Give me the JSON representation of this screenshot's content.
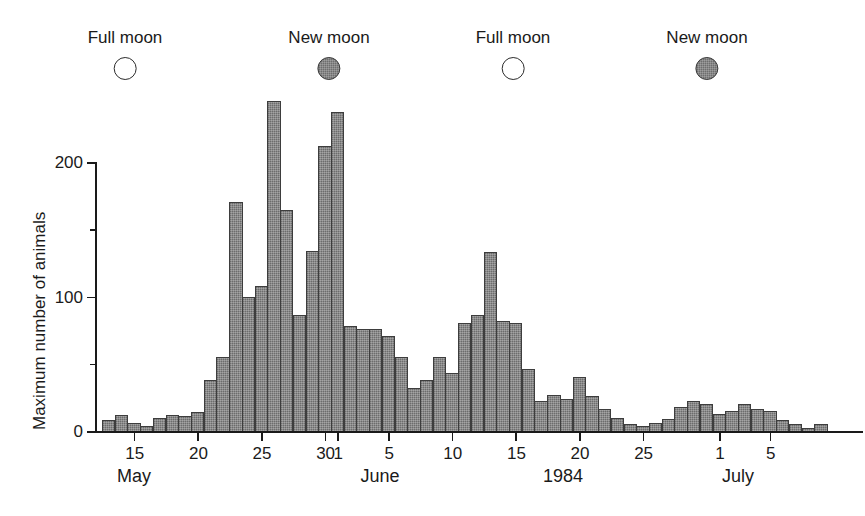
{
  "figure": {
    "background": "#ffffff",
    "ink_color": "#1a1a1a",
    "bar_fill": "#8a8a8a",
    "bar_edge": "#3d3d3d"
  },
  "moon_phases": [
    {
      "label": "Full moon",
      "phase": "full",
      "x_px": 125
    },
    {
      "label": "New moon",
      "phase": "new",
      "x_px": 329
    },
    {
      "label": "Full moon",
      "phase": "full",
      "x_px": 513
    },
    {
      "label": "New moon",
      "phase": "new",
      "x_px": 707
    }
  ],
  "axes": {
    "y_label": "Maximum number of animals",
    "y_major_ticks": [
      "0",
      "100",
      "200"
    ],
    "y_major_values": [
      0,
      100,
      200
    ],
    "y_minor_values": [
      50,
      150
    ],
    "x_tick_labels": [
      "15",
      "20",
      "25",
      "30",
      "1",
      "5",
      "10",
      "15",
      "20",
      "25",
      "1",
      "5"
    ],
    "month_labels": [
      {
        "text": "May",
        "x_px": 134
      },
      {
        "text": "June",
        "x_px": 380
      },
      {
        "text": "1984",
        "x_px": 563
      },
      {
        "text": "July",
        "x_px": 738
      }
    ]
  },
  "chart_data": {
    "type": "bar",
    "title": "",
    "xlabel": "",
    "ylabel": "Maximum number of animals",
    "ylim": [
      0,
      250
    ],
    "grid": false,
    "legend": "none",
    "year": "1984",
    "x_tick_labels": [
      "15",
      "20",
      "25",
      "30",
      "1",
      "5",
      "10",
      "15",
      "20",
      "25",
      "1",
      "5"
    ],
    "x_tick_dates": [
      "May 15",
      "May 20",
      "May 25",
      "May 30",
      "Jun 1",
      "Jun 5",
      "Jun 10",
      "Jun 15",
      "Jun 20",
      "Jun 25",
      "Jul 1",
      "Jul 5"
    ],
    "bin_width_days": 1,
    "categories": [
      "May 13",
      "May 14",
      "May 15",
      "May 16",
      "May 17",
      "May 18",
      "May 19",
      "May 20",
      "May 21",
      "May 22",
      "May 23",
      "May 24",
      "May 25",
      "May 26",
      "May 27",
      "May 28",
      "May 29",
      "May 30",
      "May 31",
      "Jun 1",
      "Jun 2",
      "Jun 3",
      "Jun 4",
      "Jun 5",
      "Jun 6",
      "Jun 7",
      "Jun 8",
      "Jun 9",
      "Jun 10",
      "Jun 11",
      "Jun 12",
      "Jun 13",
      "Jun 14",
      "Jun 15",
      "Jun 16",
      "Jun 17",
      "Jun 18",
      "Jun 19",
      "Jun 20",
      "Jun 21",
      "Jun 22",
      "Jun 23",
      "Jun 24",
      "Jun 25",
      "Jun 26",
      "Jun 27",
      "Jun 28",
      "Jun 29",
      "Jun 30",
      "Jul 1",
      "Jul 2",
      "Jul 3",
      "Jul 4",
      "Jul 5",
      "Jul 6",
      "Jul 7",
      "Jul 8"
    ],
    "values": [
      8,
      12,
      6,
      4,
      10,
      12,
      11,
      14,
      38,
      55,
      170,
      100,
      108,
      245,
      164,
      86,
      134,
      212,
      237,
      78,
      76,
      76,
      71,
      55,
      32,
      38,
      55,
      43,
      80,
      86,
      133,
      82,
      80,
      46,
      22,
      27,
      24,
      40,
      26,
      16,
      10,
      5,
      4,
      6,
      9,
      18,
      22,
      20,
      13,
      15,
      20,
      16,
      15,
      8,
      5,
      2,
      5
    ],
    "moon_phase_annotations": [
      {
        "label": "Full moon",
        "phase": "full"
      },
      {
        "label": "New moon",
        "phase": "new"
      },
      {
        "label": "Full moon",
        "phase": "full"
      },
      {
        "label": "New moon",
        "phase": "new"
      }
    ]
  }
}
